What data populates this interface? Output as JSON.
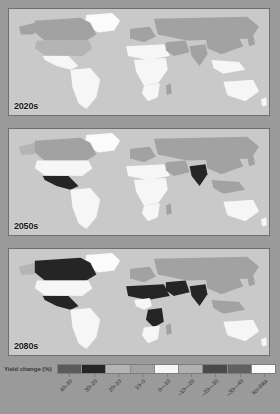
{
  "figure": {
    "background_color": "#9a9a9a",
    "panel_background_color": "#c9c9c9"
  },
  "panels": [
    {
      "id": "2020s",
      "era_label": "2020s"
    },
    {
      "id": "2050s",
      "era_label": "2050s"
    },
    {
      "id": "2080s",
      "era_label": "2080s"
    }
  ],
  "legend": {
    "title": "Yield change (%)",
    "position": "bottom",
    "orientation": "horizontal",
    "categories": [
      {
        "label": "40–30",
        "color": "#5a5a5a"
      },
      {
        "label": "30–20",
        "color": "#252525"
      },
      {
        "label": "20–10",
        "color": "#b4b4b4"
      },
      {
        "label": "10–0",
        "color": "#a2a2a2"
      },
      {
        "label": "0––10",
        "color": "#f6f6f6"
      },
      {
        "label": "–10––20",
        "color": "#b0b0b0"
      },
      {
        "label": "–20––30",
        "color": "#4a4a4a"
      },
      {
        "label": "–30––40",
        "color": "#606060"
      },
      {
        "label": "No data",
        "color": "#fbfbfb"
      }
    ]
  },
  "chart_data": {
    "type": "map",
    "subtitle": "",
    "xlabel": "",
    "ylabel": "",
    "legend_title": "Yield change (%)",
    "legend_position": "bottom",
    "grid": false,
    "projection": "equirectangular",
    "bins": [
      "40–30",
      "30–20",
      "20–10",
      "10–0",
      "0––10",
      "–10––20",
      "–20––30",
      "–30––40",
      "No data"
    ],
    "bin_colors": [
      "#5a5a5a",
      "#252525",
      "#b4b4b4",
      "#a2a2a2",
      "#f6f6f6",
      "#b0b0b0",
      "#4a4a4a",
      "#606060",
      "#fbfbfb"
    ],
    "panels": [
      {
        "era": "2020s",
        "regions": [
          {
            "name": "Canada",
            "bin": "10–0",
            "value": 5
          },
          {
            "name": "United States",
            "bin": "10–0",
            "value": 4
          },
          {
            "name": "Greenland",
            "bin": "No data",
            "value": null
          },
          {
            "name": "Mexico",
            "bin": "0––10",
            "value": -4
          },
          {
            "name": "Brazil",
            "bin": "0––10",
            "value": -3
          },
          {
            "name": "Argentina",
            "bin": "0––10",
            "value": -2
          },
          {
            "name": "Western Europe",
            "bin": "10–0",
            "value": 6
          },
          {
            "name": "Russia",
            "bin": "10–0",
            "value": 7
          },
          {
            "name": "North Africa",
            "bin": "10–0",
            "value": 3
          },
          {
            "name": "Sub-Saharan Africa",
            "bin": "0––10",
            "value": -5
          },
          {
            "name": "Middle East",
            "bin": "10–0",
            "value": 2
          },
          {
            "name": "India",
            "bin": "10–0",
            "value": 1
          },
          {
            "name": "China",
            "bin": "10–0",
            "value": 5
          },
          {
            "name": "Southeast Asia",
            "bin": "0––10",
            "value": -2
          },
          {
            "name": "Australia",
            "bin": "0––10",
            "value": -6
          }
        ]
      },
      {
        "era": "2050s",
        "regions": [
          {
            "name": "Canada",
            "bin": "10–0",
            "value": 6
          },
          {
            "name": "United States",
            "bin": "0––10",
            "value": -3
          },
          {
            "name": "Greenland",
            "bin": "No data",
            "value": null
          },
          {
            "name": "Mexico",
            "bin": "–30––40",
            "value": -33
          },
          {
            "name": "Brazil",
            "bin": "0––10",
            "value": -6
          },
          {
            "name": "Argentina",
            "bin": "0––10",
            "value": -5
          },
          {
            "name": "Western Europe",
            "bin": "10–0",
            "value": 4
          },
          {
            "name": "Russia",
            "bin": "10–0",
            "value": 8
          },
          {
            "name": "North Africa",
            "bin": "0––10",
            "value": -8
          },
          {
            "name": "Sub-Saharan Africa",
            "bin": "0––10",
            "value": -9
          },
          {
            "name": "Middle East",
            "bin": "10–0",
            "value": 1
          },
          {
            "name": "India",
            "bin": "–30––40",
            "value": -38
          },
          {
            "name": "China",
            "bin": "10–0",
            "value": 3
          },
          {
            "name": "Southeast Asia",
            "bin": "10–0",
            "value": 2
          },
          {
            "name": "Australia",
            "bin": "0––10",
            "value": -7
          }
        ]
      },
      {
        "era": "2080s",
        "regions": [
          {
            "name": "Canada",
            "bin": "–30––40",
            "value": -36
          },
          {
            "name": "United States",
            "bin": "0––10",
            "value": -5
          },
          {
            "name": "Greenland",
            "bin": "No data",
            "value": null
          },
          {
            "name": "Mexico",
            "bin": "–30––40",
            "value": -35
          },
          {
            "name": "Brazil",
            "bin": "0––10",
            "value": -8
          },
          {
            "name": "Argentina",
            "bin": "0––10",
            "value": -6
          },
          {
            "name": "Western Europe",
            "bin": "10–0",
            "value": 2
          },
          {
            "name": "Russia",
            "bin": "10–0",
            "value": 5
          },
          {
            "name": "North Africa",
            "bin": "–30––40",
            "value": -37
          },
          {
            "name": "Central Africa",
            "bin": "–30––40",
            "value": -34
          },
          {
            "name": "Southern Africa",
            "bin": "0––10",
            "value": -9
          },
          {
            "name": "Middle East",
            "bin": "–30––40",
            "value": -39
          },
          {
            "name": "India",
            "bin": "–30––40",
            "value": -40
          },
          {
            "name": "China",
            "bin": "10–0",
            "value": 1
          },
          {
            "name": "Southeast Asia",
            "bin": "10–0",
            "value": 1
          },
          {
            "name": "Australia",
            "bin": "0––10",
            "value": -8
          }
        ]
      }
    ]
  }
}
